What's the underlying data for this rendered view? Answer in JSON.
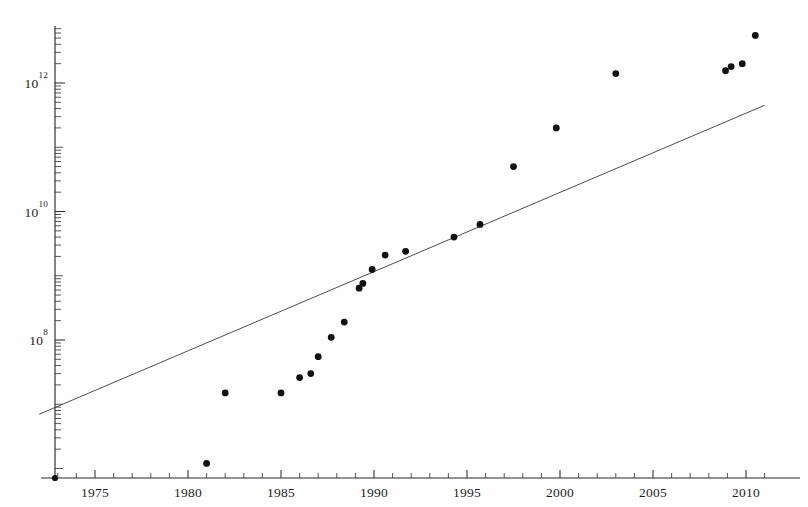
{
  "chart_data": {
    "type": "scatter",
    "title": "",
    "subtitle": "",
    "xlabel": "",
    "ylabel": "",
    "xlim": [
      1972.8,
      2011.5
    ],
    "ylim": [
      10000000.0,
      13000000000000.0
    ],
    "yscale": "log",
    "xscale": "linear",
    "grid": false,
    "legend": null,
    "x_ticks": [
      1975,
      1980,
      1985,
      1990,
      1995,
      2000,
      2005,
      2010
    ],
    "x_tick_labels": [
      "1975",
      "1980",
      "1985",
      "1990",
      "1995",
      "2000",
      "2005",
      "2010"
    ],
    "x_minor_tick_step": 1,
    "y_ticks": [
      100000000.0,
      10000000000.0,
      1000000000000.0
    ],
    "y_tick_labels": [
      "10^8",
      "10^10",
      "10^12"
    ],
    "y_tick_mantissas": [
      "10",
      "10",
      "10"
    ],
    "y_tick_exponents": [
      "8",
      "10",
      "12"
    ],
    "series": [
      {
        "name": "observations",
        "marker": "circle",
        "color": "#111111",
        "points": [
          {
            "x": 1981.0,
            "y": 1200000.0
          },
          {
            "x": 1982.0,
            "y": 15000000.0
          },
          {
            "x": 1985.0,
            "y": 15000000.0
          },
          {
            "x": 1986.0,
            "y": 26000000.0
          },
          {
            "x": 1986.6,
            "y": 30000000.0
          },
          {
            "x": 1987.0,
            "y": 55000000.0
          },
          {
            "x": 1987.7,
            "y": 110000000.0
          },
          {
            "x": 1988.4,
            "y": 190000000.0
          },
          {
            "x": 1989.2,
            "y": 640000000.0
          },
          {
            "x": 1989.4,
            "y": 760000000.0
          },
          {
            "x": 1989.9,
            "y": 1250000000.0
          },
          {
            "x": 1990.6,
            "y": 2100000000.0
          },
          {
            "x": 1991.7,
            "y": 2400000000.0
          },
          {
            "x": 1994.3,
            "y": 4000000000.0
          },
          {
            "x": 1995.7,
            "y": 6300000000.0
          },
          {
            "x": 1997.5,
            "y": 50000000000.0
          },
          {
            "x": 1999.8,
            "y": 200000000000.0
          },
          {
            "x": 2003.0,
            "y": 1400000000000.0
          },
          {
            "x": 2008.9,
            "y": 1550000000000.0
          },
          {
            "x": 2009.2,
            "y": 1800000000000.0
          },
          {
            "x": 2009.8,
            "y": 2000000000000.0
          },
          {
            "x": 2010.5,
            "y": 5500000000000.0
          }
        ]
      }
    ],
    "fit_line": {
      "name": "exponential-fit",
      "color": "#444444",
      "x_start": 1972.0,
      "x_end": 2011.0,
      "y_start": 7000000.0,
      "y_end": 450000000000.0
    }
  },
  "figure": {
    "background_color": "#fefefe",
    "axis_color": "#2b2b2b",
    "point_color": "#111111",
    "line_color": "#444444"
  }
}
